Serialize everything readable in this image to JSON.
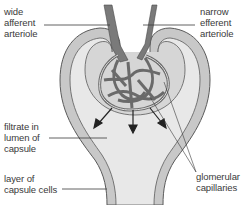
{
  "diagram": {
    "labels": {
      "afferent": "wide\nafferent\narteriole",
      "efferent": "narrow\nefferent\narteriole",
      "filtrate": "filtrate in\nlumen of\ncapsule",
      "capsule_cells": "layer of\ncapsule cells",
      "capillaries": "glomerular\ncapillaries"
    },
    "colors": {
      "capsule_wall": "#c8c8c8",
      "lumen": "#e8e8e8",
      "outline": "#5a5a5a",
      "vessel": "#7a7a7a",
      "text": "#3a3a3a"
    }
  }
}
